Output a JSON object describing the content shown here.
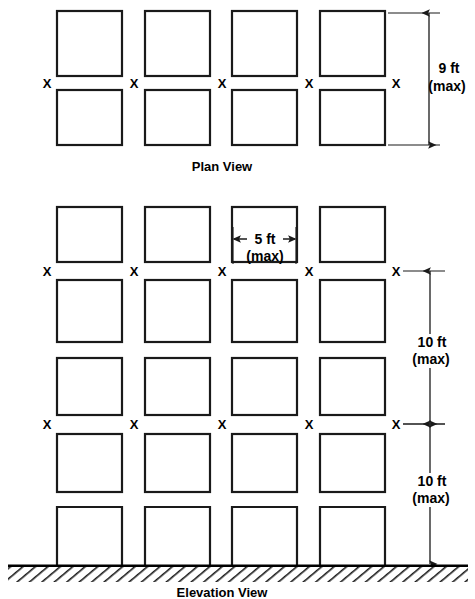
{
  "figure": {
    "line_color": "#1a1a1a",
    "background_color": "#ffffff"
  },
  "plan_view": {
    "label": "Plan View",
    "columns": 4,
    "rows": 2,
    "x_mark": "X",
    "x_mark_count": 5,
    "dimension": {
      "value": "9 ft",
      "qualifier": "(max)",
      "orientation": "vertical",
      "position": "right"
    }
  },
  "elevation_view": {
    "label": "Elevation View",
    "columns": 4,
    "rows": 5,
    "x_mark": "X",
    "x_mark_rows": 2,
    "x_marks_per_row": 5,
    "width_dimension": {
      "value": "5 ft",
      "qualifier": "(max)",
      "orientation": "horizontal"
    },
    "height_dimensions": [
      {
        "value": "10 ft",
        "qualifier": "(max)",
        "orientation": "vertical"
      },
      {
        "value": "10 ft",
        "qualifier": "(max)",
        "orientation": "vertical"
      }
    ],
    "ground": {
      "type": "hatched-ground-line"
    }
  }
}
